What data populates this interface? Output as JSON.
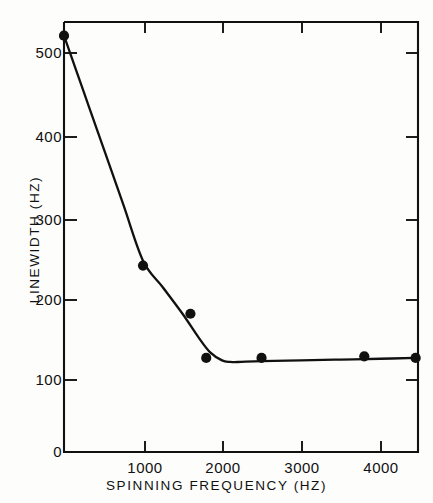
{
  "figure": {
    "background_color": "#fdfdfc",
    "ink_color": "#111111"
  },
  "chart_data": {
    "type": "scatter",
    "title": "",
    "subtitle": "",
    "xlabel": "SPINNING  FREQUENCY  (HZ)",
    "ylabel": "LINEWIDTH  (HZ)",
    "xlim": [
      0,
      4480
    ],
    "ylim": [
      0,
      535
    ],
    "grid": false,
    "legend": "none",
    "frame": "box",
    "tick_direction": "inward",
    "x_ticks": [
      1000,
      2000,
      3000,
      4000
    ],
    "x_tick_labels": [
      "1000",
      "2000",
      "3000",
      "4000"
    ],
    "y_ticks": [
      0,
      100,
      200,
      300,
      400,
      500
    ],
    "y_tick_labels": [
      "0",
      "100",
      "200",
      "300",
      "400",
      "500"
    ],
    "series": [
      {
        "name": "measured linewidth",
        "marker": "filled-circle",
        "marker_color": "#111111",
        "x": [
          0,
          1000,
          1600,
          1800,
          2500,
          3800,
          4450
        ],
        "y": [
          518,
          232,
          172,
          117,
          117,
          119,
          117
        ]
      },
      {
        "name": "fitted curve",
        "marker": "none",
        "line_color": "#111111",
        "x": [
          0,
          250,
          500,
          750,
          1000,
          1250,
          1500,
          1700,
          1850,
          2000,
          2100,
          2200,
          2500,
          3000,
          3500,
          4000,
          4450
        ],
        "y": [
          518,
          448,
          378,
          308,
          238,
          205,
          172,
          143,
          124,
          114,
          112,
          112,
          113,
          114,
          115,
          116,
          117
        ]
      }
    ],
    "annotations": []
  },
  "axis_titles": {
    "x": "SPINNING  FREQUENCY  (HZ)",
    "y": "LINEWIDTH  (HZ)"
  }
}
